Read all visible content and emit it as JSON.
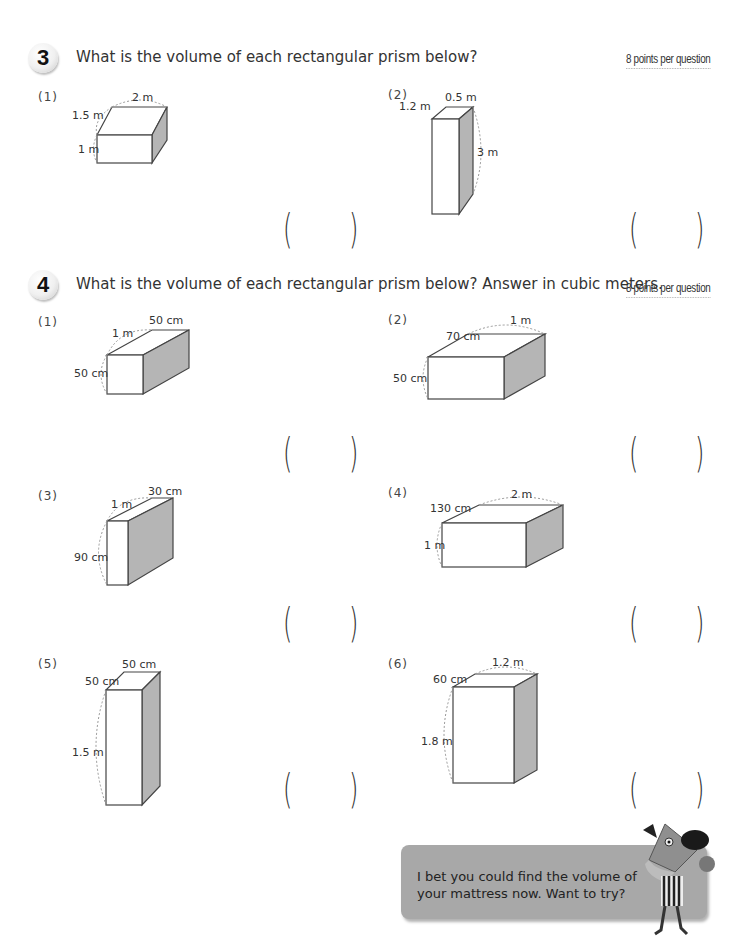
{
  "section3": {
    "number": "3",
    "prompt": "What is the volume of each rectangular prism below?",
    "points": "8 points per question",
    "questions": [
      {
        "label": "(1)",
        "length": "2 m",
        "depth": "1.5 m",
        "height": "1 m",
        "answer": ""
      },
      {
        "label": "(2)",
        "length": "0.5 m",
        "depth": "1.2 m",
        "height": "3 m",
        "answer": ""
      }
    ]
  },
  "section4": {
    "number": "4",
    "prompt": "What is the volume of each rectangular prism below? Answer in cubic meters.",
    "points": "8 points per question",
    "questions": [
      {
        "label": "(1)",
        "length": "50 cm",
        "depth": "1 m",
        "height": "50 cm",
        "answer": ""
      },
      {
        "label": "(2)",
        "length": "1 m",
        "depth": "70 cm",
        "height": "50 cm",
        "answer": ""
      },
      {
        "label": "(3)",
        "length": "30 cm",
        "depth": "1 m",
        "height": "90 cm",
        "answer": ""
      },
      {
        "label": "(4)",
        "length": "2 m",
        "depth": "130 cm",
        "height": "1 m",
        "answer": ""
      },
      {
        "label": "(5)",
        "length": "50 cm",
        "depth": "50 cm",
        "height": "1.5 m",
        "answer": ""
      },
      {
        "label": "(6)",
        "length": "1.2 m",
        "depth": "60 cm",
        "height": "1.8 m",
        "answer": ""
      }
    ]
  },
  "speech": {
    "text": "I bet you could find the volume of your mattress now. Want to try?"
  },
  "colors": {
    "shade": "#b5b5b5",
    "speech_bg": "#a8a8a8"
  }
}
